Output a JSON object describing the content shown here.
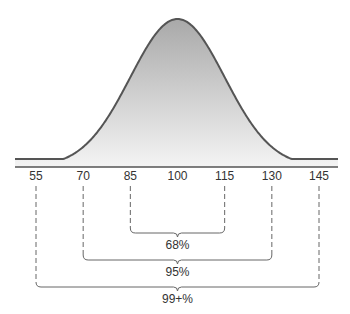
{
  "chart_data": {
    "type": "area",
    "title": "",
    "mean": 100,
    "sd": 15,
    "xlabel": "",
    "ylabel": "",
    "xlim": [
      50,
      150
    ],
    "grid": false,
    "tick_labels": [
      "55",
      "70",
      "85",
      "100",
      "115",
      "130",
      "145"
    ],
    "ticks": [
      55,
      70,
      85,
      100,
      115,
      130,
      145
    ],
    "ranges": [
      {
        "from": 85,
        "to": 115,
        "label": "68%"
      },
      {
        "from": 70,
        "to": 130,
        "label": "95%"
      },
      {
        "from": 55,
        "to": 145,
        "label": "99+%"
      }
    ]
  },
  "colors": {
    "curve_stroke": "#555555",
    "fill_top": "#a9a9a9",
    "fill_bottom": "#f2f2f2",
    "axis": "#555555",
    "bracket": "#666666",
    "text": "#333333"
  }
}
